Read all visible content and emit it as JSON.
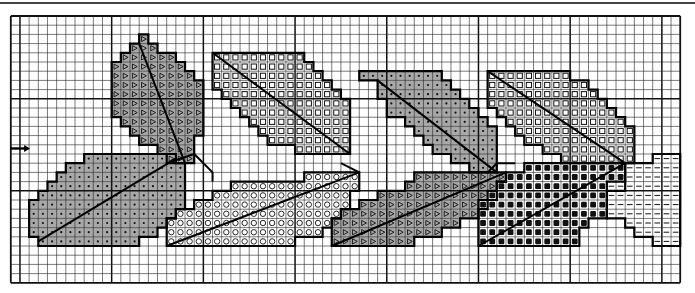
{
  "pattern": {
    "title": "",
    "grid": {
      "origin_x": 10.8,
      "origin_y": 16,
      "cell_w": 9.17,
      "cell_h": 9.2,
      "cols": 73,
      "rows": 29,
      "heavy_col_offset": 1,
      "heavy_row_offset": 9,
      "heavy_every": 10,
      "line_color": "#222222",
      "heavy_color": "#111111"
    },
    "center_marker": {
      "icon": "arrow-right-icon",
      "row": 14.4,
      "col_start": 0,
      "col_end": 2
    },
    "colors": {
      "gray_fill": "#a8a8a8",
      "white_fill": "#ffffff",
      "outline": "#000000",
      "symbol": "#111111"
    },
    "legend_symbols": {
      "dot": "medium gray with dot",
      "triangle": "medium gray with triangle",
      "square": "white with open square",
      "circle": "white with open circle",
      "filled": "white with filled square",
      "dash": "white with dash"
    },
    "leaves": [
      {
        "name": "leaf-dot-lower-left",
        "symbol": "dot",
        "fill": "gray",
        "spans": [
          [
            15,
            8,
            17
          ],
          [
            16,
            6,
            18
          ],
          [
            17,
            5,
            18
          ],
          [
            18,
            4,
            18
          ],
          [
            19,
            3,
            18
          ],
          [
            20,
            2,
            18
          ],
          [
            21,
            2,
            17
          ],
          [
            22,
            2,
            16
          ],
          [
            23,
            2,
            15
          ],
          [
            24,
            3,
            13
          ]
        ],
        "vein": [
          [
            3,
            24.5
          ],
          [
            18,
            15.5
          ]
        ]
      },
      {
        "name": "leaf-triangle-top-left",
        "symbol": "triangle",
        "fill": "gray",
        "spans": [
          [
            2,
            14,
            14
          ],
          [
            3,
            13,
            15
          ],
          [
            4,
            12,
            17
          ],
          [
            5,
            11,
            18
          ],
          [
            6,
            11,
            19
          ],
          [
            7,
            11,
            20
          ],
          [
            8,
            11,
            20
          ],
          [
            9,
            11,
            20
          ],
          [
            10,
            11,
            20
          ],
          [
            11,
            12,
            20
          ],
          [
            12,
            13,
            20
          ],
          [
            13,
            14,
            19
          ],
          [
            14,
            16,
            19
          ],
          [
            15,
            17,
            19
          ]
        ],
        "vein": [
          [
            14,
            3
          ],
          [
            19,
            16
          ]
        ]
      },
      {
        "name": "leaf-square-top",
        "symbol": "square",
        "fill": "white",
        "spans": [
          [
            4,
            22,
            31
          ],
          [
            5,
            22,
            32
          ],
          [
            6,
            22,
            33
          ],
          [
            7,
            22,
            34
          ],
          [
            8,
            23,
            35
          ],
          [
            9,
            24,
            36
          ],
          [
            10,
            25,
            36
          ],
          [
            11,
            26,
            36
          ],
          [
            12,
            27,
            36
          ],
          [
            13,
            28,
            36
          ],
          [
            14,
            31,
            36
          ]
        ],
        "vein": [
          [
            22,
            4
          ],
          [
            37,
            15
          ]
        ]
      },
      {
        "name": "leaf-circle-mid",
        "symbol": "circle",
        "fill": "white",
        "spans": [
          [
            17,
            32,
            37
          ],
          [
            18,
            24,
            37
          ],
          [
            19,
            22,
            36
          ],
          [
            20,
            20,
            36
          ],
          [
            21,
            18,
            35
          ],
          [
            22,
            17,
            34
          ],
          [
            23,
            17,
            33
          ],
          [
            24,
            17,
            30
          ]
        ],
        "vein": [
          [
            17,
            25
          ],
          [
            38,
            17
          ]
        ]
      },
      {
        "name": "leaf-dot-top-right",
        "symbol": "dot",
        "fill": "gray",
        "spans": [
          [
            6,
            38,
            46
          ],
          [
            7,
            40,
            47
          ],
          [
            8,
            40,
            48
          ],
          [
            9,
            41,
            49
          ],
          [
            10,
            41,
            50
          ],
          [
            11,
            43,
            51
          ],
          [
            12,
            44,
            52
          ],
          [
            13,
            45,
            52
          ],
          [
            14,
            46,
            52
          ],
          [
            15,
            48,
            52
          ],
          [
            16,
            50,
            52
          ]
        ],
        "vein": [
          [
            40,
            7
          ],
          [
            53,
            17
          ]
        ]
      },
      {
        "name": "leaf-triangle-bottom-mid",
        "symbol": "triangle",
        "fill": "gray",
        "spans": [
          [
            17,
            44,
            53
          ],
          [
            18,
            43,
            52
          ],
          [
            19,
            40,
            52
          ],
          [
            20,
            38,
            51
          ],
          [
            21,
            36,
            50
          ],
          [
            22,
            35,
            48
          ],
          [
            23,
            35,
            46
          ],
          [
            24,
            35,
            43
          ]
        ],
        "vein": [
          [
            35,
            25
          ],
          [
            54,
            17
          ]
        ]
      },
      {
        "name": "leaf-square-top-right",
        "symbol": "square",
        "fill": "white",
        "spans": [
          [
            6,
            52,
            60
          ],
          [
            7,
            52,
            62
          ],
          [
            8,
            52,
            63
          ],
          [
            9,
            52,
            64
          ],
          [
            10,
            53,
            65
          ],
          [
            11,
            54,
            66
          ],
          [
            12,
            55,
            67
          ],
          [
            13,
            56,
            67
          ],
          [
            14,
            58,
            67
          ],
          [
            15,
            60,
            67
          ]
        ],
        "vein": [
          [
            52,
            6
          ],
          [
            67,
            16
          ]
        ]
      },
      {
        "name": "leaf-filled-bottom-right",
        "symbol": "filled",
        "fill": "white",
        "spans": [
          [
            16,
            56,
            66
          ],
          [
            17,
            54,
            66
          ],
          [
            18,
            53,
            66
          ],
          [
            19,
            52,
            64
          ],
          [
            20,
            51,
            64
          ],
          [
            21,
            51,
            64
          ],
          [
            22,
            51,
            62
          ],
          [
            23,
            51,
            61
          ],
          [
            24,
            51,
            61
          ]
        ],
        "vein": [
          [
            51,
            25
          ],
          [
            67,
            16
          ]
        ]
      },
      {
        "name": "leaf-dash-far-right",
        "symbol": "dash",
        "fill": "white",
        "spans": [
          [
            15,
            70,
            72
          ],
          [
            16,
            67,
            72
          ],
          [
            17,
            67,
            72
          ],
          [
            18,
            65,
            72
          ],
          [
            19,
            65,
            72
          ],
          [
            20,
            65,
            72
          ],
          [
            21,
            65,
            72
          ],
          [
            22,
            67,
            72
          ],
          [
            23,
            68,
            72
          ],
          [
            24,
            70,
            72
          ]
        ],
        "vein": null
      }
    ],
    "stems": [
      [
        [
          17,
          16
        ],
        [
          20,
          15
        ],
        [
          22,
          17
        ],
        [
          22,
          18
        ]
      ],
      [
        [
          36,
          16
        ],
        [
          38,
          17
        ]
      ],
      [
        [
          52,
          17
        ],
        [
          53,
          16
        ],
        [
          55,
          16
        ]
      ]
    ]
  }
}
